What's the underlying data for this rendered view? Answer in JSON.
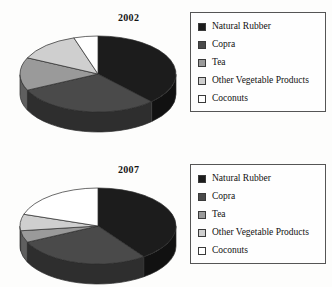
{
  "page": {
    "top_edge_text": "",
    "bottom_edge_text": ""
  },
  "colors": {
    "natural_rubber": "#1c1c1c",
    "copra": "#4a4a4a",
    "tea": "#9a9a9a",
    "other_vegetable_products": "#cfcfcf",
    "coconuts": "#ffffff",
    "outline": "#2b2b2b",
    "legend_border": "#555555",
    "background": "#fdfdfc"
  },
  "legend": {
    "items": [
      {
        "label": "Natural Rubber",
        "color": "#1c1c1c"
      },
      {
        "label": "Copra",
        "color": "#4a4a4a"
      },
      {
        "label": "Tea",
        "color": "#9a9a9a"
      },
      {
        "label": "Other Vegetable Products",
        "color": "#cfcfcf"
      },
      {
        "label": "Coconuts",
        "color": "#ffffff"
      }
    ]
  },
  "charts": [
    {
      "title": "2002"
    },
    {
      "title": "2007"
    }
  ],
  "chart_data": [
    {
      "type": "pie",
      "title": "2002",
      "categories": [
        "Natural Rubber",
        "Copra",
        "Tea",
        "Other Vegetable Products",
        "Coconuts"
      ],
      "values": [
        38,
        30,
        14,
        13,
        5
      ],
      "unit": "percent",
      "colors": [
        "#1c1c1c",
        "#4a4a4a",
        "#9a9a9a",
        "#cfcfcf",
        "#ffffff"
      ],
      "legend_position": "right",
      "three_d": true,
      "start_angle_deg": -90,
      "direction": "clockwise"
    },
    {
      "type": "pie",
      "title": "2007",
      "categories": [
        "Natural Rubber",
        "Copra",
        "Tea",
        "Other Vegetable Products",
        "Coconuts"
      ],
      "values": [
        40,
        28,
        5,
        7,
        20
      ],
      "unit": "percent",
      "colors": [
        "#1c1c1c",
        "#4a4a4a",
        "#9a9a9a",
        "#cfcfcf",
        "#ffffff"
      ],
      "legend_position": "right",
      "three_d": true,
      "start_angle_deg": -90,
      "direction": "clockwise"
    }
  ]
}
